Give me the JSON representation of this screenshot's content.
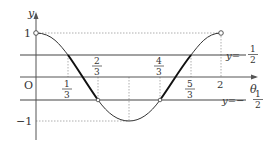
{
  "diagram": {
    "type": "function-graph",
    "function": "y = cos(pi*theta), 0 < theta <= 2",
    "axes": {
      "x_label": "θ",
      "y_label": "y",
      "origin_label": "O"
    },
    "y_ticks": {
      "one": "1",
      "minus_one": "−1"
    },
    "x_ticks": {
      "third": {
        "num": "1",
        "den": "3"
      },
      "two_thirds": {
        "num": "2",
        "den": "3"
      },
      "four_thirds": {
        "num": "4",
        "den": "3"
      },
      "five_thirds": {
        "num": "5",
        "den": "3"
      },
      "two": "2"
    },
    "lines": {
      "upper": {
        "prefix": "y=",
        "num": "1",
        "den": "2"
      },
      "lower": {
        "prefix": "y=−",
        "num": "1",
        "den": "2"
      }
    },
    "highlighted_intervals": [
      "1/3 ≤ θ ≤ 2/3",
      "4/3 ≤ θ ≤ 5/3"
    ],
    "colors": {
      "curve": "#333333",
      "axis": "#555555",
      "guide": "#999999"
    }
  }
}
